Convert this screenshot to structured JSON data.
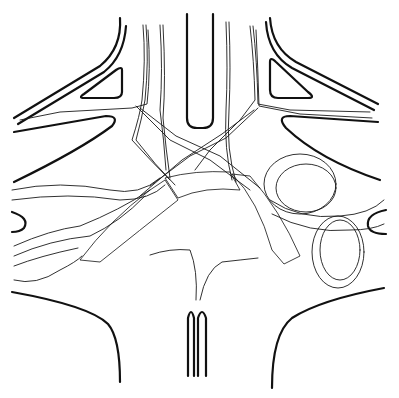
{
  "figure": {
    "colors": {
      "ink": "#111111",
      "background": "#ffffff"
    },
    "regions": [
      "left-upper-lobe",
      "right-upper-lobe",
      "central-column",
      "left-lower-region",
      "right-lower-region",
      "bottom-stalk"
    ]
  }
}
